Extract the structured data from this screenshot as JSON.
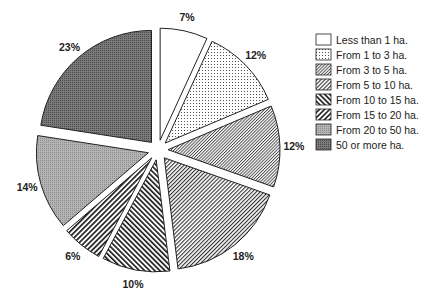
{
  "chart_data": {
    "type": "pie",
    "title": "",
    "unit": "%",
    "categories": [
      "Less than 1 ha.",
      "From 1 to 3 ha.",
      "From 3 to 5 ha.",
      "From 5 to 10 ha.",
      "From 10 to 15 ha.",
      "From 15 to 20 ha.",
      "From 20 to 50 ha.",
      "50 or more ha."
    ],
    "values": [
      7,
      12,
      12,
      18,
      10,
      6,
      14,
      23
    ],
    "labels": [
      "7%",
      "12%",
      "12%",
      "18%",
      "10%",
      "6%",
      "14%",
      "23%"
    ],
    "start_angle": "12 o'clock",
    "direction": "clockwise",
    "exploded": true,
    "legend_position": "right",
    "patterns": [
      "white",
      "dots",
      "diagonal-fine",
      "diagonal-medium",
      "diagonal-bold-backslash",
      "diagonal-bold-slash",
      "light-grey-screen",
      "dark-grey-screen"
    ]
  },
  "legend": {
    "items": [
      {
        "label": "Less than 1 ha.",
        "pattern": "white"
      },
      {
        "label": "From 1 to 3 ha.",
        "pattern": "dots"
      },
      {
        "label": "From 3 to 5 ha.",
        "pattern": "diagonal-fine"
      },
      {
        "label": "From 5 to 10 ha.",
        "pattern": "diagonal-medium"
      },
      {
        "label": "From 10 to 15 ha.",
        "pattern": "diagonal-bold-backslash"
      },
      {
        "label": "From 15 to 20 ha.",
        "pattern": "diagonal-bold-slash"
      },
      {
        "label": "From 20 to 50 ha.",
        "pattern": "light-grey-screen"
      },
      {
        "label": "50 or more ha.",
        "pattern": "dark-grey-screen"
      }
    ]
  },
  "colors": {
    "outline": "#222222",
    "light_grey": "#a8a8a8",
    "dark_grey": "#6e6e6e",
    "background": "#ffffff"
  }
}
